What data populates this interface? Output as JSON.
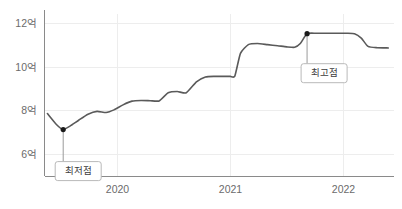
{
  "chart_data": {
    "type": "line",
    "title": "",
    "xlabel": "",
    "ylabel": "",
    "ylim": [
      5.0,
      12.4
    ],
    "xlim": [
      2019.35,
      2022.45
    ],
    "grid": true,
    "legend_position": "none",
    "y_ticks": [
      {
        "value": 6,
        "label": "6억"
      },
      {
        "value": 8,
        "label": "8억"
      },
      {
        "value": 10,
        "label": "10억"
      },
      {
        "value": 12,
        "label": "12억"
      }
    ],
    "x_ticks": [
      {
        "value": 2020,
        "label": "2020"
      },
      {
        "value": 2021,
        "label": "2021"
      },
      {
        "value": 2022,
        "label": "2022"
      }
    ],
    "series": [
      {
        "name": "가격",
        "color": "#5a5a5a",
        "x": [
          2019.38,
          2019.46,
          2019.52,
          2019.58,
          2019.66,
          2019.74,
          2019.82,
          2019.9,
          2019.97,
          2020.05,
          2020.13,
          2020.21,
          2020.29,
          2020.37,
          2020.45,
          2020.53,
          2020.61,
          2020.7,
          2020.78,
          2020.86,
          2020.94,
          2021.0,
          2021.04,
          2021.09,
          2021.16,
          2021.24,
          2021.33,
          2021.42,
          2021.5,
          2021.57,
          2021.62,
          2021.68,
          2021.76,
          2021.85,
          2021.95,
          2022.03,
          2022.1,
          2022.16,
          2022.22,
          2022.3,
          2022.4
        ],
        "y": [
          7.85,
          7.35,
          7.12,
          7.28,
          7.56,
          7.82,
          7.95,
          7.9,
          8.02,
          8.25,
          8.42,
          8.45,
          8.44,
          8.43,
          8.8,
          8.86,
          8.8,
          9.3,
          9.52,
          9.55,
          9.55,
          9.55,
          9.56,
          10.6,
          11.0,
          11.05,
          11.0,
          10.95,
          10.9,
          10.88,
          11.05,
          11.5,
          11.52,
          11.52,
          11.52,
          11.52,
          11.5,
          11.3,
          10.92,
          10.86,
          10.85
        ]
      }
    ],
    "annotations": [
      {
        "name": "lowest-point",
        "label": "최저점",
        "x": 2019.52,
        "y": 7.12,
        "marker": true
      },
      {
        "name": "highest-point",
        "label": "최고점",
        "x": 2021.68,
        "y": 11.5,
        "marker": true
      }
    ],
    "colors": {
      "line": "#5a5a5a",
      "grid": "#ededed",
      "axis": "#8a8a8a",
      "tick_label": "#6b6b6b",
      "marker": "#1a1a1a",
      "callout_border": "#b9b9b9",
      "callout_fill": "#ffffff",
      "background": "#ffffff"
    }
  }
}
